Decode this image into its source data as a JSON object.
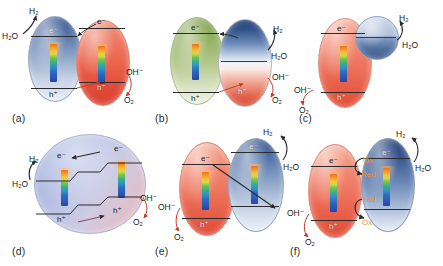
{
  "figure": {
    "background_color": "#ffffff",
    "panel_count": 6
  },
  "labels": {
    "h2": "H₂",
    "h2o": "H₂O",
    "oh": "OH⁻",
    "o2": "O₂",
    "electron": "e⁻",
    "hole": "h⁺",
    "ox": "Ox",
    "red": "Red"
  },
  "colors": {
    "blue_particle": "#4f6ea6",
    "red_particle": "#e9604a",
    "green_particle": "#93b264",
    "lavender_particle": "#b3bde2",
    "sphere_blue": "#7d96c0",
    "mediator_orange": "#e8922c",
    "arrow_dark": "#2b2b2b",
    "arrow_red": "#c0392b",
    "background": "#ffffff"
  },
  "panels": [
    {
      "id": "a",
      "caption": "(a)",
      "description": "Two-particle Z-scheme: blue hydrogen-evolution particle coupled to red oxygen-evolution particle",
      "particles": [
        {
          "name": "blue-particle",
          "color": "#4f6ea6",
          "shape": "ellipse",
          "role": "hydrogen-evolution"
        },
        {
          "name": "red-particle",
          "color": "#e9604a",
          "shape": "ellipse",
          "role": "oxygen-evolution"
        }
      ],
      "level_labels": [
        "e⁻",
        "h⁺",
        "e⁻",
        "h⁺"
      ],
      "reaction_labels": [
        "H₂",
        "H₂O",
        "OH⁻",
        "O₂"
      ]
    },
    {
      "id": "b",
      "caption": "(b)",
      "description": "Green particle coupled to a blue-white-red gradient particle",
      "particles": [
        {
          "name": "green-particle",
          "color": "#93b264",
          "shape": "ellipse",
          "role": "light-absorber"
        },
        {
          "name": "gradient-particle",
          "color": "#1f3c77",
          "shape": "ellipse",
          "role": "dual-site"
        }
      ],
      "level_labels": [
        "e⁻",
        "h⁺",
        "h⁺"
      ],
      "reaction_labels": [
        "H₂",
        "H₂O",
        "OH⁻",
        "O₂"
      ]
    },
    {
      "id": "c",
      "caption": "(c)",
      "description": "Red oxygen-evolution particle with attached blue co-catalyst sphere",
      "particles": [
        {
          "name": "red-particle",
          "color": "#ec6e57",
          "shape": "ellipse",
          "role": "oxygen-evolution"
        },
        {
          "name": "blue-sphere",
          "color": "#7d96c0",
          "shape": "circle",
          "role": "hydrogen-evolution-cocatalyst"
        }
      ],
      "level_labels": [
        "e⁻",
        "h⁺"
      ],
      "reaction_labels": [
        "H₂",
        "H₂O",
        "OH⁻",
        "O₂"
      ]
    },
    {
      "id": "d",
      "caption": "(d)",
      "description": "Single large lavender particle containing an internal Z-scheme energy cascade",
      "particles": [
        {
          "name": "lavender-particle",
          "color": "#b3bde2",
          "shape": "circle",
          "role": "single-particle-z-scheme"
        }
      ],
      "level_labels": [
        "e⁻",
        "e⁻",
        "h⁺",
        "h⁺"
      ],
      "reaction_labels": [
        "H₂",
        "H₂O",
        "OH⁻",
        "O₂"
      ]
    },
    {
      "id": "e",
      "caption": "(e)",
      "description": "Red particle on the left and blue particle on the right joined by a diagonal electron-transfer arrow",
      "particles": [
        {
          "name": "red-particle",
          "color": "#ec6e57",
          "shape": "ellipse",
          "role": "oxygen-evolution"
        },
        {
          "name": "blue-particle",
          "color": "#4f6ea6",
          "shape": "ellipse",
          "role": "hydrogen-evolution"
        }
      ],
      "level_labels": [
        "e⁻",
        "h⁺",
        "e⁻"
      ],
      "reaction_labels": [
        "H₂",
        "H₂O",
        "OH⁻",
        "O₂"
      ]
    },
    {
      "id": "f",
      "caption": "(f)",
      "description": "Red and blue particles linked by a soluble Ox/Red redox shuttle mediator",
      "particles": [
        {
          "name": "red-particle",
          "color": "#ec6e57",
          "shape": "ellipse",
          "role": "oxygen-evolution"
        },
        {
          "name": "blue-particle",
          "color": "#38568f",
          "shape": "ellipse",
          "role": "hydrogen-evolution"
        }
      ],
      "level_labels": [
        "e⁻",
        "h⁺",
        "e⁻"
      ],
      "mediator_labels": [
        "Ox",
        "Red",
        "Red",
        "Ox"
      ],
      "reaction_labels": [
        "H₂",
        "H₂O",
        "OH⁻",
        "O₂"
      ]
    }
  ]
}
